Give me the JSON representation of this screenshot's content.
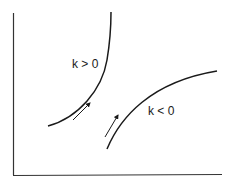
{
  "figure": {
    "labels": {
      "upper_curve": "k > 0",
      "lower_curve": "k < 0"
    },
    "colors": {
      "line": "#1a1a1a",
      "background": "#ffffff"
    }
  }
}
